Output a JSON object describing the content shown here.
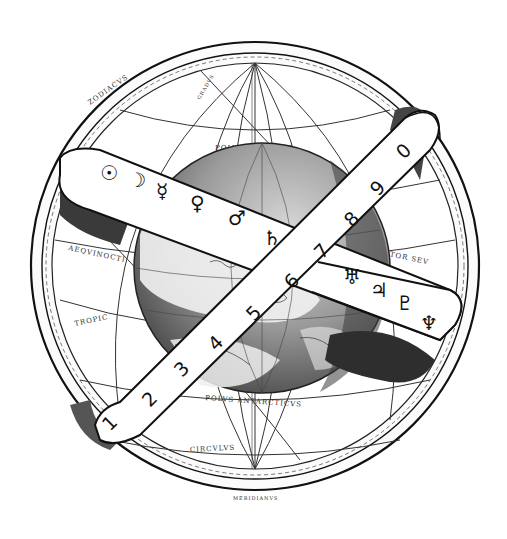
{
  "illustration": {
    "subject": "Armillary sphere with globe and planetary bands",
    "style": "monochrome engraving",
    "colors": {
      "background": "#ffffff",
      "ink": "#111111",
      "shade": "#3a3a3a",
      "globe_shade": "#6a6a6a"
    }
  },
  "planet_band": {
    "symbols": [
      "☉",
      "☽",
      "☿",
      "♀",
      "♂",
      "♄",
      "♅",
      "♃",
      "♇",
      "♆"
    ],
    "symbol_names": [
      "sun-icon",
      "moon-icon",
      "mercury-icon",
      "venus-icon",
      "mars-icon",
      "saturn-icon",
      "uranus-icon",
      "jupiter-icon",
      "pluto-icon",
      "neptune-icon"
    ]
  },
  "number_band": {
    "numbers": [
      "1",
      "2",
      "3",
      "4",
      "5",
      "6",
      "7",
      "8",
      "9",
      "0"
    ]
  },
  "sphere_labels": {
    "equinoctial": "AEQVINOCTI",
    "tropic": "TROPIC",
    "circulus": "CIRCVLVS",
    "arcticus": "POLVS ARCTICVS",
    "antarcticus": "POLVS ANTARCTICVS",
    "aequator": "AEQVATOR SEV",
    "meridianus": "MERIDIANVS",
    "zodiac": "ZODIACVS",
    "gradus": "GRADVS",
    "circulus_ant": "CIRCVLVS ANTARCTICVS",
    "linea": "LINEA AEQVINOCTIALIS"
  }
}
